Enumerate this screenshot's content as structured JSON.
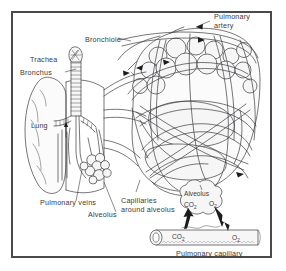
{
  "figure": {
    "title_visible": false,
    "border_color": "#4a4a4e",
    "background_color": "#ffffff",
    "ink_color": "#3c3c40",
    "text_color": "#3a3a3c"
  },
  "labels": {
    "pulmonary_artery_line1": "Pulmonary",
    "pulmonary_artery_line2": "artery",
    "bronchiole": "Bronchiole",
    "trachea": "Trachea",
    "bronchus": "Bronchus",
    "lung": "Lung",
    "pulmonary_veins": "Pulmonary veins",
    "alveolus_left": "Alveolus",
    "capillaries_line1": "Capillaries",
    "capillaries_line2": "around alveolus",
    "alveolus_inset": "Alveolus",
    "pulmonary_capillary": "Pulmonary capillary"
  },
  "gas_exchange": {
    "alveolus_co2": "CO",
    "alveolus_co2_sub": "2",
    "alveolus_o2": "O",
    "alveolus_o2_sub": "2",
    "capillary_co2": "CO",
    "capillary_co2_sub": "2",
    "capillary_o2": "O",
    "capillary_o2_sub": "2",
    "co2_direction": "capillary-to-alveolus",
    "o2_direction": "alveolus-to-capillary"
  },
  "structures": {
    "lung_lobe": "lung-lobe",
    "trachea_tube": "ringed-trachea",
    "bronchial_tree": "bronchial-tree",
    "alveolar_clusters": "alveolar-clusters",
    "alveolar_sac_mass": "alveolar-sac-cluster",
    "capillary_network": "capillary-network",
    "bronchiole_tube": "ridged-bronchiole",
    "inset_alveolus": "inset-alveolus",
    "inset_capillary": "inset-capillary-tube"
  }
}
